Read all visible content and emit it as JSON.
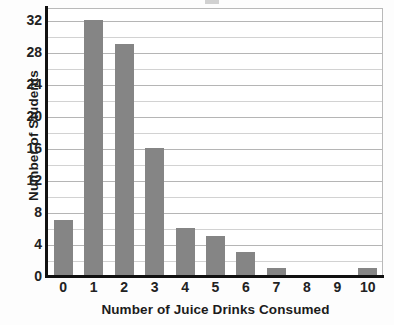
{
  "chart_data": {
    "type": "bar",
    "title": "",
    "xlabel": "Number of Juice Drinks Consumed",
    "ylabel": "Number of Students",
    "categories": [
      "0",
      "1",
      "2",
      "3",
      "4",
      "5",
      "6",
      "7",
      "8",
      "9",
      "10"
    ],
    "values": [
      7,
      32,
      29,
      16,
      6,
      5,
      3,
      1,
      0,
      0,
      1
    ],
    "ylim": [
      0,
      33.5
    ],
    "ytick_labels": [
      "0",
      "4",
      "8",
      "12",
      "16",
      "20",
      "24",
      "28",
      "32"
    ],
    "ytick_values": [
      0,
      4,
      8,
      12,
      16,
      20,
      24,
      28,
      32
    ],
    "gridline_values": [
      2,
      4,
      6,
      8,
      10,
      12,
      14,
      16,
      18,
      20,
      22,
      24,
      26,
      28,
      30,
      32
    ],
    "grid": true,
    "legend": null,
    "series": [
      {
        "name": "Number of Students",
        "values": [
          7,
          32,
          29,
          16,
          6,
          5,
          3,
          1,
          0,
          0,
          1
        ]
      }
    ],
    "colors": {
      "bar": "#858585",
      "gridline_major": "#b5b5b5",
      "gridline_minor": "#d2d2d2",
      "axis": "#111111",
      "text": "#1b1b1b",
      "plot_background": "#ffffff"
    }
  }
}
